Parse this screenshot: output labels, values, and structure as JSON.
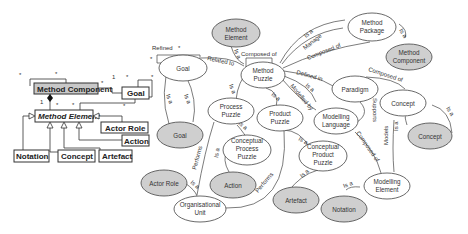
{
  "uml": {
    "method_component": "Method Component",
    "goal": "Goal",
    "method_element": "Method Element",
    "actor_role": "Actor Role",
    "action": "Action",
    "notation": "Notation",
    "concept": "Concept",
    "artefact": "Artefact",
    "mult_star": "*",
    "mult_one": "1"
  },
  "nodes": {
    "method_element": [
      "Method",
      "Element"
    ],
    "method_package": [
      "Method",
      "Package"
    ],
    "method_component": [
      "Method",
      "Component"
    ],
    "goal_white": [
      "Goal"
    ],
    "method_puzzle": [
      "Method",
      "Puzzle"
    ],
    "paradigm": [
      "Paradigm"
    ],
    "concept_white": [
      "Concept"
    ],
    "concept_grey": [
      "Concept"
    ],
    "goal_grey": [
      "Goal"
    ],
    "process_puzzle": [
      "Process",
      "Puzzle"
    ],
    "product_puzzle": [
      "Product",
      "Puzzle"
    ],
    "modelling_language": [
      "Modelling",
      "Language"
    ],
    "conceptual_process_puzzle": [
      "Conceptual",
      "Process",
      "Puzzle"
    ],
    "conceptual_product_puzzle": [
      "Conceptual",
      "Product",
      "Puzzle"
    ],
    "actor_role": [
      "Actor Role"
    ],
    "action": [
      "Action"
    ],
    "artefact": [
      "Artefact"
    ],
    "notation": [
      "Notation"
    ],
    "modelling_element": [
      "Modelling",
      "Element"
    ],
    "organisational_unit": [
      "Organisational",
      "Unit"
    ]
  },
  "edges": {
    "refined": "Refined",
    "related_to": "Related to",
    "composed_of": "Composed of",
    "is_a": "Is a",
    "manage": "Manage",
    "defined_in": "Defined in",
    "modelled_by": "Modelled by",
    "supports": "Supports",
    "performs": "Performs",
    "models": "Models"
  }
}
